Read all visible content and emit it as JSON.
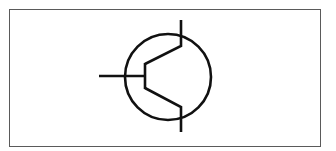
{
  "diagram": {
    "title": "",
    "symbol": "bipolar-junction-transistor",
    "terminals": [
      "base",
      "collector",
      "emitter"
    ],
    "colors": {
      "stroke": "#111111",
      "frame": "#5a5a5a",
      "background": "#ffffff"
    }
  }
}
